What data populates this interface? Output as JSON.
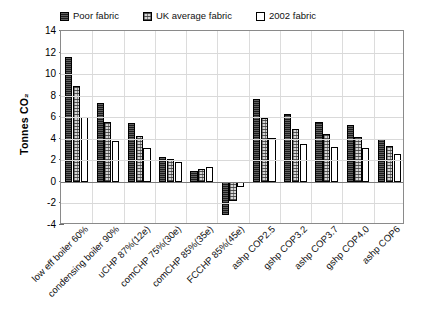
{
  "chart_data": {
    "type": "bar",
    "title": "",
    "xlabel": "",
    "ylabel": "Tonnes CO₂",
    "ylim": [
      -4,
      14
    ],
    "yticks": [
      14,
      12,
      10,
      8,
      6,
      4,
      2,
      0,
      -2,
      -4
    ],
    "grid": true,
    "legend_position": "top",
    "categories": [
      "low eff boiler 60%",
      "condensing boiler 90%",
      "uCHP 87%(12e)",
      "comCHP 75%(30e)",
      "comCHP 85%(35e)",
      "FCCHP 85%(45e)",
      "ashp COP2.5",
      "gshp COP3.2",
      "ashp COP3.7",
      "gshp COP4.0",
      "ashp COP6"
    ],
    "series": [
      {
        "name": "Poor fabric",
        "fill": "dark",
        "color": "#1b1b1b",
        "values": [
          11.6,
          7.3,
          5.5,
          2.3,
          1.0,
          -3.1,
          7.7,
          6.3,
          5.6,
          5.3,
          4.0
        ]
      },
      {
        "name": "UK average fabric",
        "fill": "mid",
        "color": "#d5d5d5",
        "values": [
          8.9,
          5.6,
          4.3,
          2.1,
          1.2,
          -1.8,
          5.9,
          4.9,
          4.4,
          4.2,
          3.3
        ]
      },
      {
        "name": "2002 fabric",
        "fill": "light",
        "color": "#ffffff",
        "values": [
          6.0,
          3.8,
          3.1,
          1.85,
          1.35,
          -0.45,
          4.1,
          3.5,
          3.2,
          3.1,
          2.6
        ]
      }
    ]
  }
}
